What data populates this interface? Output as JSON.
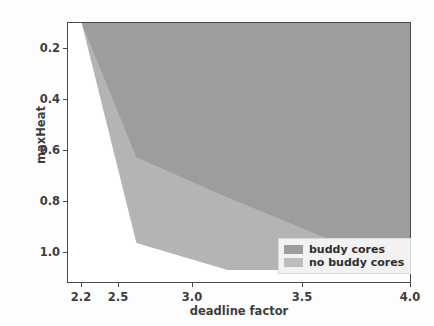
{
  "chart_data": {
    "type": "area",
    "title": "",
    "xlabel": "deadline factor",
    "ylabel": "maxHeat",
    "xlim": [
      2.125,
      4.0
    ],
    "ylim": [
      1.12,
      0.155
    ],
    "y_inverted": true,
    "grid": false,
    "legend_position": "lower right",
    "xticks": [
      2.2,
      2.5,
      3.0,
      3.5,
      4.0
    ],
    "xtick_labels": [
      "2.2",
      "2.5",
      "3.0",
      "3.5",
      "4.0"
    ],
    "yticks": [
      0.2,
      0.4,
      0.6,
      0.8,
      1.0
    ],
    "ytick_labels": [
      "0.2",
      "0.4",
      "0.6",
      "0.8",
      "1.0"
    ],
    "series": [
      {
        "name": "no buddy cores",
        "color": "#b4b4b4",
        "fill_to": 1.12,
        "x": [
          2.2,
          2.5,
          3.0,
          4.0
        ],
        "values": [
          1.12,
          0.3,
          0.2,
          0.2
        ]
      },
      {
        "name": "buddy cores",
        "color": "#9d9d9d",
        "fill_to": 1.12,
        "x": [
          2.2,
          2.5,
          3.0,
          3.5,
          4.0
        ],
        "values": [
          1.12,
          0.62,
          0.47,
          0.33,
          0.2
        ]
      }
    ]
  },
  "axes": {
    "ylabel": "maxHeat",
    "xlabel": "deadline factor",
    "xtick_labels": [
      "2.2",
      "2.5",
      "3.0",
      "3.5",
      "4.0"
    ],
    "ytick_labels": [
      "0.2",
      "0.4",
      "0.6",
      "0.8",
      "1.0"
    ]
  },
  "legend": {
    "entries": [
      {
        "label": "buddy cores",
        "color": "#9d9d9d"
      },
      {
        "label": "no buddy cores",
        "color": "#bdbdbd"
      }
    ]
  },
  "colors": {
    "buddy": "#9d9d9d",
    "no_buddy": "#b4b4b4",
    "axis": "#4a4a4a",
    "text": "#3d3d3d",
    "legend_bg": "#f2f2f2"
  }
}
